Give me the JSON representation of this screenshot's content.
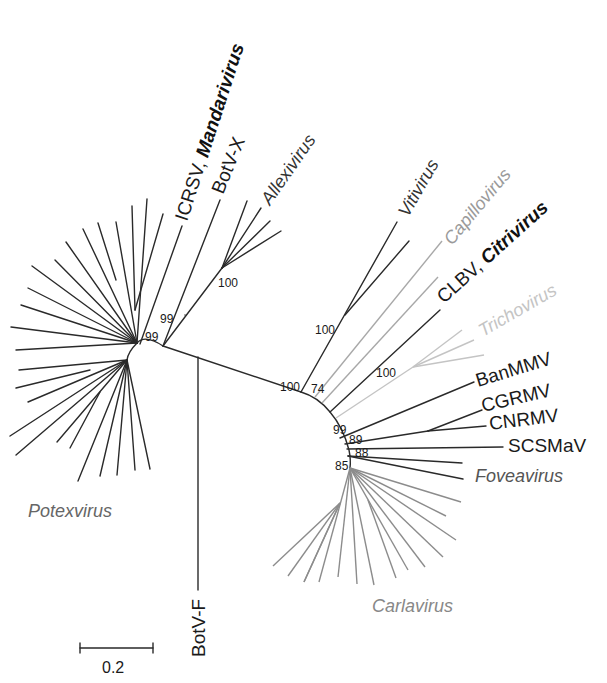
{
  "figure": {
    "type": "unrooted phylogenetic tree",
    "scale_bar": {
      "label": "0.2"
    },
    "taxa_labels": {
      "icrsv_prefix": "ICRSV, ",
      "icrsv_genus": "Mandarivirus",
      "botvx": "BotV-X",
      "allexivirus": "Allexivirus",
      "vitivirus": "Vitivirus",
      "capillovirus": "Capillovirus",
      "clbv_prefix": "CLBV, ",
      "clbv_genus": "Citrivirus",
      "trichovirus": "Trichovirus",
      "banmmv": "BanMMV",
      "cgrmv": "CGRMV",
      "cnrmv": "CNRMV",
      "scsmav": "SCSMaV",
      "foveavirus": "Foveavirus",
      "carlavirus": "Carlavirus",
      "potexvirus": "Potexvirus",
      "botvf": "BotV-F"
    },
    "bootstrap": {
      "potex_node": "99",
      "botvx_node": "99",
      "allexi_node": "100",
      "central_node": "100",
      "viti_74": "74",
      "viti_100": "100",
      "tricho_100": "100",
      "banmmv_99": "99",
      "cnrmv_89": "89",
      "scsmav_88": "88",
      "carla_85": "85"
    },
    "colors": {
      "branch_default": "#2a2a2a",
      "capillovirus": "#9a9a9a",
      "trichovirus": "#c4c4c4",
      "carlavirus": "#8c8c8c",
      "group_label": "#6e6e6e"
    }
  }
}
